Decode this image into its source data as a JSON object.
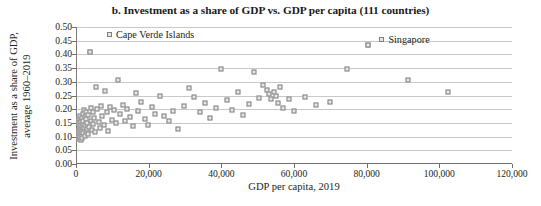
{
  "chart_data": {
    "type": "scatter",
    "title": "b. Investment as a share of GDP vs. GDP per capita (111 countries)",
    "xlabel": "GDP per capita, 2019",
    "ylabel_line1": "Investment as a share of GDP,",
    "ylabel_line2": "average 1960–2019",
    "xlim": [
      0,
      120000
    ],
    "ylim": [
      0.0,
      0.5
    ],
    "grid": true,
    "legend": "none",
    "xticks": [
      0,
      20000,
      40000,
      60000,
      80000,
      100000,
      120000
    ],
    "xtick_labels": [
      "0",
      "20,000",
      "40,000",
      "60,000",
      "80,000",
      "100,000",
      "120,000"
    ],
    "yticks": [
      0.0,
      0.05,
      0.1,
      0.15,
      0.2,
      0.25,
      0.3,
      0.35,
      0.4,
      0.45,
      0.5
    ],
    "ytick_labels": [
      "0.00",
      "0.05",
      "0.10",
      "0.15",
      "0.20",
      "0.25",
      "0.30",
      "0.35",
      "0.40",
      "0.45",
      "0.50"
    ],
    "marker_style": "open-square",
    "marker_edge_color": "#7f7f7f",
    "marker_fill_color": "#e6e6e6",
    "gridline_color": "#c8c8c8",
    "axis_color": "#6e6e6e",
    "annotations": [
      {
        "label": "Cape Verde Islands",
        "x": 3800,
        "y": 0.41,
        "text_x": 8500,
        "text_y": 0.472
      },
      {
        "label": "Singapore",
        "x": 80500,
        "y": 0.435,
        "text_x": 83500,
        "text_y": 0.452
      }
    ],
    "points": [
      [
        700,
        0.105
      ],
      [
        760,
        0.122
      ],
      [
        820,
        0.148
      ],
      [
        880,
        0.091
      ],
      [
        920,
        0.163
      ],
      [
        980,
        0.112
      ],
      [
        1020,
        0.135
      ],
      [
        1080,
        0.175
      ],
      [
        1120,
        0.098
      ],
      [
        1180,
        0.143
      ],
      [
        1240,
        0.118
      ],
      [
        1300,
        0.159
      ],
      [
        1360,
        0.086
      ],
      [
        1420,
        0.128
      ],
      [
        1480,
        0.152
      ],
      [
        1540,
        0.107
      ],
      [
        1600,
        0.168
      ],
      [
        1660,
        0.139
      ],
      [
        1720,
        0.095
      ],
      [
        1780,
        0.121
      ],
      [
        1840,
        0.183
      ],
      [
        1900,
        0.146
      ],
      [
        1960,
        0.113
      ],
      [
        2050,
        0.157
      ],
      [
        2150,
        0.131
      ],
      [
        2250,
        0.196
      ],
      [
        2350,
        0.104
      ],
      [
        2450,
        0.172
      ],
      [
        2550,
        0.141
      ],
      [
        2650,
        0.119
      ],
      [
        2750,
        0.164
      ],
      [
        2850,
        0.188
      ],
      [
        2950,
        0.126
      ],
      [
        3100,
        0.151
      ],
      [
        3250,
        0.109
      ],
      [
        3400,
        0.178
      ],
      [
        3600,
        0.134
      ],
      [
        3800,
        0.41
      ],
      [
        4000,
        0.203
      ],
      [
        4200,
        0.158
      ],
      [
        4400,
        0.124
      ],
      [
        4600,
        0.191
      ],
      [
        4800,
        0.147
      ],
      [
        5000,
        0.167
      ],
      [
        5300,
        0.116
      ],
      [
        5600,
        0.282
      ],
      [
        5900,
        0.199
      ],
      [
        6200,
        0.154
      ],
      [
        6500,
        0.132
      ],
      [
        6800,
        0.211
      ],
      [
        7200,
        0.176
      ],
      [
        7600,
        0.143
      ],
      [
        8000,
        0.265
      ],
      [
        8400,
        0.188
      ],
      [
        8900,
        0.121
      ],
      [
        9400,
        0.207
      ],
      [
        9900,
        0.162
      ],
      [
        10400,
        0.196
      ],
      [
        11000,
        0.149
      ],
      [
        11600,
        0.305
      ],
      [
        12200,
        0.183
      ],
      [
        12800,
        0.217
      ],
      [
        13400,
        0.156
      ],
      [
        14000,
        0.201
      ],
      [
        14800,
        0.171
      ],
      [
        15600,
        0.138
      ],
      [
        16400,
        0.259
      ],
      [
        17200,
        0.194
      ],
      [
        18000,
        0.225
      ],
      [
        18900,
        0.166
      ],
      [
        19800,
        0.143
      ],
      [
        20800,
        0.208
      ],
      [
        21800,
        0.182
      ],
      [
        23000,
        0.249
      ],
      [
        24200,
        0.176
      ],
      [
        25500,
        0.157
      ],
      [
        26800,
        0.193
      ],
      [
        28200,
        0.128
      ],
      [
        29600,
        0.213
      ],
      [
        31000,
        0.278
      ],
      [
        32500,
        0.246
      ],
      [
        34000,
        0.189
      ],
      [
        35500,
        0.224
      ],
      [
        37000,
        0.168
      ],
      [
        38500,
        0.205
      ],
      [
        40000,
        0.348
      ],
      [
        41500,
        0.232
      ],
      [
        43000,
        0.196
      ],
      [
        44500,
        0.261
      ],
      [
        46000,
        0.179
      ],
      [
        47500,
        0.219
      ],
      [
        49000,
        0.337
      ],
      [
        50500,
        0.242
      ],
      [
        51500,
        0.288
      ],
      [
        52500,
        0.271
      ],
      [
        53200,
        0.254
      ],
      [
        53800,
        0.236
      ],
      [
        54400,
        0.263
      ],
      [
        55000,
        0.247
      ],
      [
        55600,
        0.222
      ],
      [
        56200,
        0.281
      ],
      [
        57000,
        0.204
      ],
      [
        58500,
        0.236
      ],
      [
        60000,
        0.192
      ],
      [
        63000,
        0.243
      ],
      [
        66000,
        0.217
      ],
      [
        70000,
        0.228
      ],
      [
        74500,
        0.348
      ],
      [
        80500,
        0.435
      ],
      [
        91500,
        0.305
      ],
      [
        102500,
        0.263
      ]
    ]
  }
}
